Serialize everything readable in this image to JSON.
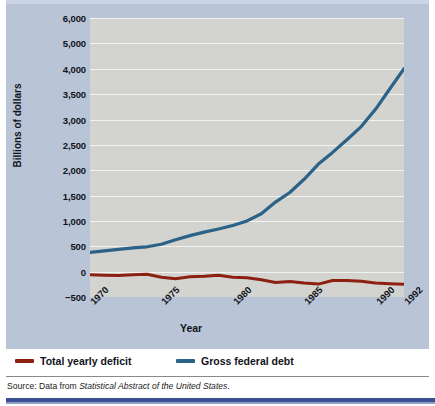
{
  "figure": {
    "background_color": "#ffffff",
    "card_color": "#b9c4d6",
    "plot_background_color": "#d3d3cf",
    "gridline_color": "#f2f2ee"
  },
  "source_note": {
    "prefix": "Source: Data from ",
    "italic": "Statistical Abstract of the United States",
    "suffix": "."
  },
  "legend": {
    "position": "below-plot",
    "items": [
      {
        "label": "Total yearly deficit",
        "color": "#8c2112"
      },
      {
        "label": "Gross federal debt",
        "color": "#2b6287"
      }
    ]
  },
  "chart_data": {
    "type": "line",
    "title": "",
    "subtitle": "",
    "xlabel": "Year",
    "ylabel": "Billions of dollars",
    "grid": true,
    "grid_axis": "y",
    "xlim": [
      1970,
      1992
    ],
    "ylim": [
      -500,
      6000
    ],
    "xticks": [
      1970,
      1975,
      1980,
      1985,
      1990,
      1992
    ],
    "xticklabels": [
      "1970",
      "1975",
      "1980",
      "1985",
      "1990",
      "1992"
    ],
    "xtick_rotation": -45,
    "yticks": [
      -500,
      0,
      500,
      1000,
      1500,
      2000,
      2500,
      3000,
      3500,
      4000,
      5000,
      6000
    ],
    "yticklabels": [
      "−500",
      "0",
      "500",
      "1,000",
      "1,500",
      "2,000",
      "2,500",
      "3,000",
      "3,500",
      "4,000",
      "5,000",
      "6,000"
    ],
    "ytick_note": "Axis divisions are drawn at equal spacing; labels run 6,000 / 5,000 / 4,000 / 3,500 / 3,000 / 2,500 / 2,000 / 1,500 / 1,000 / 500 / 0 / −500 as printed.",
    "x": [
      1970,
      1971,
      1972,
      1973,
      1974,
      1975,
      1976,
      1977,
      1978,
      1979,
      1980,
      1981,
      1982,
      1983,
      1984,
      1985,
      1986,
      1987,
      1988,
      1989,
      1990,
      1991,
      1992
    ],
    "series": [
      {
        "name": "Gross federal debt",
        "color": "#2b6287",
        "values": [
          380,
          410,
          440,
          470,
          490,
          540,
          630,
          710,
          780,
          840,
          910,
          1000,
          1140,
          1370,
          1560,
          1820,
          2120,
          2350,
          2600,
          2860,
          3200,
          3600,
          4000
        ]
      },
      {
        "name": "Total yearly deficit",
        "color": "#8c2112",
        "values": [
          -60,
          -70,
          -75,
          -60,
          -50,
          -110,
          -140,
          -100,
          -90,
          -70,
          -110,
          -120,
          -160,
          -215,
          -195,
          -225,
          -245,
          -175,
          -175,
          -190,
          -225,
          -240,
          -250
        ]
      }
    ]
  }
}
